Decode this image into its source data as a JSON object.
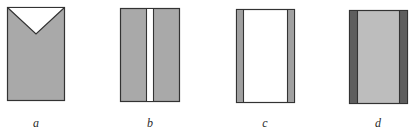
{
  "figures": [
    {
      "id": "a",
      "label": "a",
      "description": "grey rectangle with white V-shaped notch at top"
    },
    {
      "id": "b",
      "label": "b",
      "description": "grey rectangle split by a narrow white vertical stripe"
    },
    {
      "id": "c",
      "label": "c",
      "description": "white rectangle with narrow grey side strips"
    },
    {
      "id": "d",
      "label": "d",
      "description": "light grey rectangle with dark grey side strips"
    }
  ],
  "colors": {
    "fill_grey": "#a9a9a9",
    "fill_light_grey": "#bdbdbd",
    "fill_dark_grey": "#5e5e5e",
    "stroke": "#333333",
    "white": "#ffffff"
  }
}
